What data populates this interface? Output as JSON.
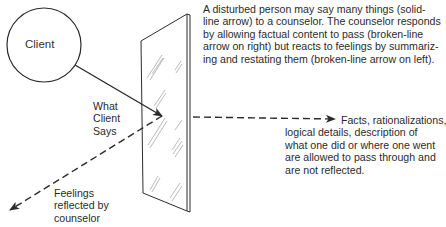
{
  "diagram": {
    "nodes": {
      "client": {
        "label": "Client"
      },
      "mirror": {
        "label": "",
        "represents": "counselor"
      }
    },
    "labels": {
      "what_client_says": [
        "What",
        "Client",
        "Says"
      ],
      "caption": [
        "A disturbed person may say many things (solid-",
        "line arrow) to a counselor. The counselor responds",
        "by allowing factual content to pass (broken-line",
        "arrow on right) but reacts to feelings by summariz-",
        "ing and restating them (broken-line arrow on left)."
      ],
      "facts": [
        "Facts, rationalizations,",
        "logical details, description of",
        "what one did or where one went",
        "are allowed to pass through and",
        "are not reflected."
      ],
      "feelings": [
        "Feelings",
        "reflected by",
        "counselor"
      ]
    },
    "edges": [
      {
        "from": "client",
        "to": "mirror",
        "style": "solid",
        "meaning": "What Client Says"
      },
      {
        "from": "mirror",
        "to": "right",
        "style": "dashed",
        "meaning": "Facts pass through"
      },
      {
        "from": "mirror",
        "to": "lower-left",
        "style": "dashed",
        "meaning": "Feelings reflected by counselor"
      }
    ],
    "colors": {
      "ink": "#2b2b2b",
      "background": "#ffffff"
    }
  }
}
